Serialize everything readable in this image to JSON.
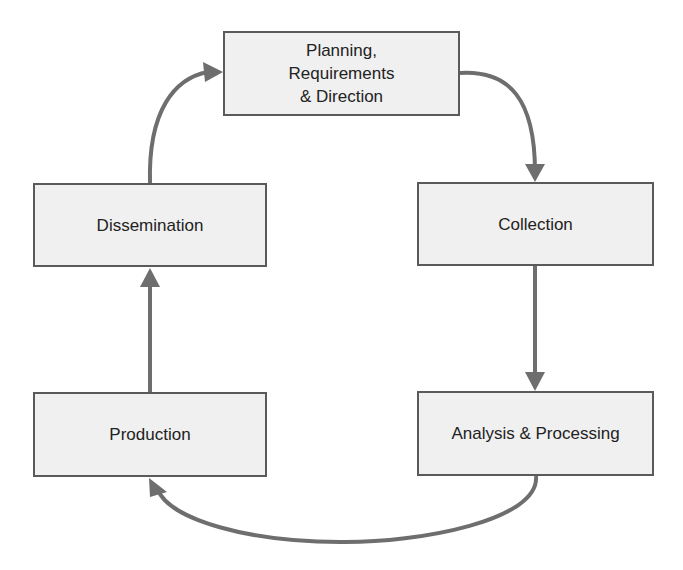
{
  "diagram": {
    "type": "cycle",
    "stroke_color": "#6e6e6e",
    "box_fill": "#f0f0f0",
    "box_border": "#5a5a5a",
    "text_color": "#222222",
    "nodes": [
      {
        "id": "planning",
        "label": "Planning,\nRequirements\n& Direction"
      },
      {
        "id": "collection",
        "label": "Collection"
      },
      {
        "id": "analysis",
        "label": "Analysis & Processing"
      },
      {
        "id": "production",
        "label": "Production"
      },
      {
        "id": "dissemination",
        "label": "Dissemination"
      }
    ],
    "edges": [
      {
        "from": "planning",
        "to": "collection"
      },
      {
        "from": "collection",
        "to": "analysis"
      },
      {
        "from": "analysis",
        "to": "production"
      },
      {
        "from": "production",
        "to": "dissemination"
      },
      {
        "from": "dissemination",
        "to": "planning"
      }
    ]
  }
}
